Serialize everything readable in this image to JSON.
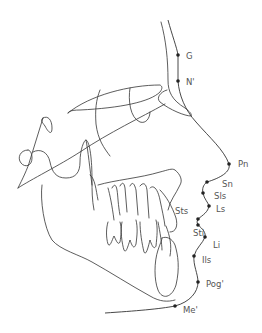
{
  "diagram": {
    "type": "cephalometric soft-tissue tracing",
    "colors": {
      "line": "#333333",
      "point": "#222222",
      "label": "#555555",
      "background": "#ffffff"
    },
    "landmarks": [
      {
        "id": "G",
        "label": "G",
        "x": 178,
        "y": 55
      },
      {
        "id": "N",
        "label": "N'",
        "x": 178,
        "y": 81
      },
      {
        "id": "Pn",
        "label": "Pn",
        "x": 229,
        "y": 164
      },
      {
        "id": "Sn",
        "label": "Sn",
        "x": 207,
        "y": 182
      },
      {
        "id": "Sls",
        "label": "Sls",
        "x": 203,
        "y": 193
      },
      {
        "id": "Ls",
        "label": "Ls",
        "x": 209,
        "y": 206
      },
      {
        "id": "Sts",
        "label": "Sts",
        "x": 198,
        "y": 219
      },
      {
        "id": "Sti",
        "label": "Sti",
        "x": 198,
        "y": 225
      },
      {
        "id": "Li",
        "label": "Li",
        "x": 205,
        "y": 237
      },
      {
        "id": "Ils",
        "label": "Ils",
        "x": 194,
        "y": 256
      },
      {
        "id": "Pog",
        "label": "Pog'",
        "x": 198,
        "y": 282
      },
      {
        "id": "Me",
        "label": "Me'",
        "x": 175,
        "y": 306
      }
    ]
  }
}
